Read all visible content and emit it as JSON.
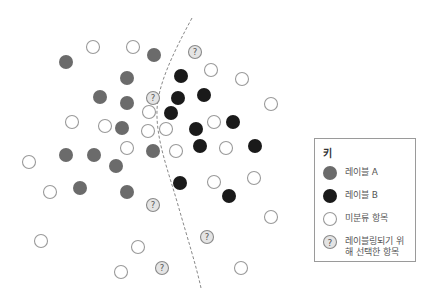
{
  "diagram": {
    "colors": {
      "label_a": "#6b6b6b",
      "label_b": "#1a1a1a",
      "unlabeled_stroke": "#9a9a9a",
      "query_fill": "#e4e4e4",
      "query_stroke": "#8a8a8a",
      "boundary": "#888888"
    },
    "point_radius": 7,
    "boundary_path": "M192,18 C172,55 158,85 157,110 C156,140 168,170 178,205 C188,240 196,265 201,288",
    "points": {
      "label_a": [
        [
          66,
          62
        ],
        [
          154,
          55
        ],
        [
          127,
          78
        ],
        [
          100,
          97
        ],
        [
          127,
          103
        ],
        [
          122,
          128
        ],
        [
          66,
          155
        ],
        [
          94,
          155
        ],
        [
          116,
          166
        ],
        [
          153,
          151
        ],
        [
          80,
          188
        ],
        [
          127,
          192
        ]
      ],
      "label_b": [
        [
          181,
          76
        ],
        [
          178,
          98
        ],
        [
          204,
          95
        ],
        [
          171,
          113
        ],
        [
          233,
          122
        ],
        [
          196,
          129
        ],
        [
          200,
          146
        ],
        [
          255,
          146
        ],
        [
          180,
          183
        ],
        [
          229,
          196
        ]
      ],
      "unlabeled": [
        [
          93,
          47
        ],
        [
          133,
          47
        ],
        [
          211,
          70
        ],
        [
          242,
          79
        ],
        [
          271,
          104
        ],
        [
          72,
          122
        ],
        [
          105,
          126
        ],
        [
          149,
          112
        ],
        [
          148,
          131
        ],
        [
          166,
          129
        ],
        [
          214,
          122
        ],
        [
          127,
          148
        ],
        [
          176,
          151
        ],
        [
          226,
          148
        ],
        [
          29,
          162
        ],
        [
          50,
          192
        ],
        [
          214,
          182
        ],
        [
          254,
          178
        ],
        [
          271,
          217
        ],
        [
          41,
          241
        ],
        [
          138,
          247
        ],
        [
          121,
          272
        ],
        [
          241,
          268
        ]
      ],
      "query": [
        [
          195,
          52
        ],
        [
          153,
          98
        ],
        [
          153,
          205
        ],
        [
          207,
          237
        ],
        [
          162,
          268
        ]
      ]
    }
  },
  "legend": {
    "title": "키",
    "items": [
      {
        "key": "label_a",
        "label": "레이블 A"
      },
      {
        "key": "label_b",
        "label": "레이블 B"
      },
      {
        "key": "unlabeled",
        "label": "미분류 항목"
      },
      {
        "key": "query",
        "label": "레이블링되기 위해 선택한 항목"
      }
    ],
    "query_glyph": "?"
  }
}
